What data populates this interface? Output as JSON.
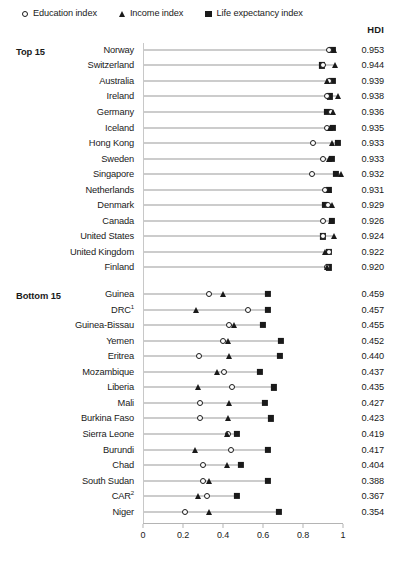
{
  "legend": {
    "items": [
      {
        "icon": "circle-marker-icon",
        "label": "Education index",
        "shape": "circle"
      },
      {
        "icon": "triangle-marker-icon",
        "label": "Income index",
        "shape": "triangle"
      },
      {
        "icon": "square-marker-icon",
        "label": "Life expectancy index",
        "shape": "square"
      }
    ]
  },
  "hdi_header": "HDI",
  "sections": [
    {
      "label": "Top 15"
    },
    {
      "label": "Bottom 15"
    }
  ],
  "chart_data": {
    "type": "scatter",
    "title": "",
    "subtitle": "",
    "xlabel": "",
    "ylabel": "",
    "xlim": [
      0,
      1
    ],
    "xticks": [
      0,
      0.2,
      0.4,
      0.6,
      0.8,
      1
    ],
    "xtick_labels": [
      "0",
      "0.2",
      "0.4",
      "0.6",
      "0.8",
      "1"
    ],
    "grid": false,
    "legend_position": "top-left",
    "value_column_header": "HDI",
    "series": [
      {
        "name": "Education index",
        "marker": "circle"
      },
      {
        "name": "Income index",
        "marker": "triangle"
      },
      {
        "name": "Life expectancy index",
        "marker": "square"
      }
    ],
    "groups": [
      {
        "name": "Top 15",
        "rows": [
          {
            "country": "Norway",
            "hdi": "0.953",
            "education": 0.93,
            "income": 0.955,
            "life_expectancy": 0.947
          },
          {
            "country": "Switzerland",
            "hdi": "0.944",
            "education": 0.899,
            "income": 0.961,
            "life_expectancy": 0.893
          },
          {
            "country": "Australia",
            "hdi": "0.939",
            "education": 0.93,
            "income": 0.921,
            "life_expectancy": 0.947
          },
          {
            "country": "Ireland",
            "hdi": "0.938",
            "education": 0.918,
            "income": 0.976,
            "life_expectancy": 0.934
          },
          {
            "country": "Germany",
            "hdi": "0.936",
            "education": 0.94,
            "income": 0.948,
            "life_expectancy": 0.922
          },
          {
            "country": "Iceland",
            "hdi": "0.935",
            "education": 0.92,
            "income": 0.934,
            "life_expectancy": 0.949
          },
          {
            "country": "Hong Kong",
            "hdi": "0.933",
            "education": 0.852,
            "income": 0.946,
            "life_expectancy": 0.974
          },
          {
            "country": "Sweden",
            "hdi": "0.933",
            "education": 0.9,
            "income": 0.93,
            "life_expectancy": 0.944
          },
          {
            "country": "Singapore",
            "hdi": "0.932",
            "education": 0.845,
            "income": 0.99,
            "life_expectancy": 0.965
          },
          {
            "country": "Netherlands",
            "hdi": "0.931",
            "education": 0.912,
            "income": 0.932,
            "life_expectancy": 0.93
          },
          {
            "country": "Denmark",
            "hdi": "0.929",
            "education": 0.924,
            "income": 0.944,
            "life_expectancy": 0.91
          },
          {
            "country": "Canada",
            "hdi": "0.926",
            "education": 0.901,
            "income": 0.938,
            "life_expectancy": 0.945
          },
          {
            "country": "United States",
            "hdi": "0.924",
            "education": 0.9,
            "income": 0.957,
            "life_expectancy": 0.9
          },
          {
            "country": "United Kingdom",
            "hdi": "0.922",
            "education": 0.928,
            "income": 0.911,
            "life_expectancy": 0.931
          },
          {
            "country": "Finland",
            "hdi": "0.920",
            "education": 0.919,
            "income": 0.922,
            "life_expectancy": 0.928
          }
        ]
      },
      {
        "name": "Bottom 15",
        "rows": [
          {
            "country": "Guinea",
            "country_note": "",
            "hdi": "0.459",
            "education": 0.33,
            "income": 0.4,
            "life_expectancy": 0.625
          },
          {
            "country": "DRC",
            "country_note": "1",
            "hdi": "0.457",
            "education": 0.525,
            "income": 0.265,
            "life_expectancy": 0.625
          },
          {
            "country": "Guinea-Bissau",
            "country_note": "",
            "hdi": "0.455",
            "education": 0.43,
            "income": 0.455,
            "life_expectancy": 0.6
          },
          {
            "country": "Yemen",
            "country_note": "",
            "hdi": "0.452",
            "education": 0.398,
            "income": 0.423,
            "life_expectancy": 0.69
          },
          {
            "country": "Eritrea",
            "country_note": "",
            "hdi": "0.440",
            "education": 0.282,
            "income": 0.43,
            "life_expectancy": 0.685
          },
          {
            "country": "Mozambique",
            "country_note": "",
            "hdi": "0.437",
            "education": 0.405,
            "income": 0.37,
            "life_expectancy": 0.585
          },
          {
            "country": "Liberia",
            "country_note": "",
            "hdi": "0.435",
            "education": 0.445,
            "income": 0.275,
            "life_expectancy": 0.655
          },
          {
            "country": "Mali",
            "country_note": "",
            "hdi": "0.427",
            "education": 0.285,
            "income": 0.43,
            "life_expectancy": 0.61
          },
          {
            "country": "Burkina Faso",
            "country_note": "",
            "hdi": "0.423",
            "education": 0.285,
            "income": 0.425,
            "life_expectancy": 0.64
          },
          {
            "country": "Sierra Leone",
            "country_note": "",
            "hdi": "0.419",
            "education": 0.425,
            "income": 0.42,
            "life_expectancy": 0.47
          },
          {
            "country": "Burundi",
            "country_note": "",
            "hdi": "0.417",
            "education": 0.44,
            "income": 0.26,
            "life_expectancy": 0.625
          },
          {
            "country": "Chad",
            "country_note": "",
            "hdi": "0.404",
            "education": 0.298,
            "income": 0.42,
            "life_expectancy": 0.49
          },
          {
            "country": "South Sudan",
            "country_note": "",
            "hdi": "0.388",
            "education": 0.3,
            "income": 0.33,
            "life_expectancy": 0.625
          },
          {
            "country": "CAR",
            "country_note": "2",
            "hdi": "0.367",
            "education": 0.32,
            "income": 0.275,
            "life_expectancy": 0.47
          },
          {
            "country": "Niger",
            "country_note": "",
            "hdi": "0.354",
            "education": 0.21,
            "income": 0.33,
            "life_expectancy": 0.68
          }
        ]
      }
    ]
  }
}
